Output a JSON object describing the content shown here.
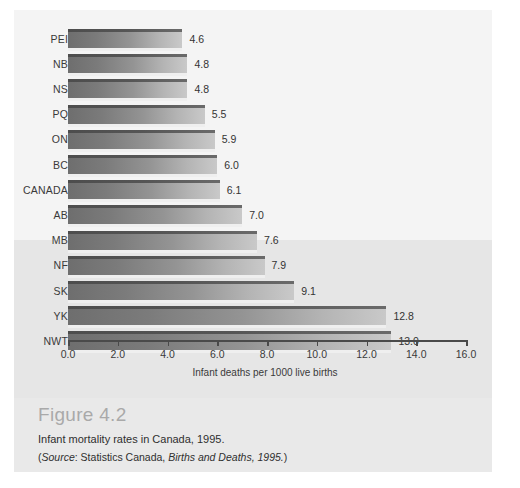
{
  "figure": {
    "number_label": "Figure 4.2",
    "caption": "Infant mortality rates in Canada, 1995.",
    "source_open_paren": "(",
    "source_word": "Source",
    "source_colon": ": Statistics Canada, ",
    "source_title": "Births and Deaths, 1995.",
    "source_close_paren": ")"
  },
  "chart_data": {
    "type": "bar",
    "orientation": "horizontal",
    "title": "Infant mortality rates in Canada, 1995.",
    "xlabel": "Infant deaths per 1000 live births",
    "ylabel": "",
    "xlim": [
      0.0,
      16.0
    ],
    "xticks": [
      "0.0",
      "2.0",
      "4.0",
      "6.0",
      "8.0",
      "10.0",
      "12.0",
      "14.0",
      "16.0"
    ],
    "xtick_values": [
      0,
      2,
      4,
      6,
      8,
      10,
      12,
      14,
      16
    ],
    "grid": false,
    "legend": null,
    "categories": [
      "PEI",
      "NB",
      "NS",
      "PQ",
      "ON",
      "BC",
      "CANADA",
      "AB",
      "MB",
      "NF",
      "SK",
      "YK",
      "NWT"
    ],
    "values": [
      4.6,
      4.8,
      4.8,
      5.5,
      5.9,
      6.0,
      6.1,
      7.0,
      7.6,
      7.9,
      9.1,
      12.8,
      13.0
    ],
    "value_labels": [
      "4.6",
      "4.8",
      "4.8",
      "5.5",
      "5.9",
      "6.0",
      "6.1",
      "7.0",
      "7.6",
      "7.9",
      "9.1",
      "12.8",
      "13.0"
    ],
    "bar_color_dark": "#6e6e6e",
    "bar_color_light": "#c9c9c9",
    "bar_edge_color": "#4d4d4d"
  },
  "colors": {
    "figure_background": "#e9e9e9",
    "plot_background_upper": "#f4f4f4",
    "plot_background_lower": "#e6e6e6",
    "axis_color": "#4a4a4a",
    "text_color": "#2f2f2f",
    "figure_number_color": "#a9a9a9"
  }
}
